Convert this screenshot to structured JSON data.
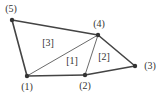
{
  "diagram": {
    "type": "finite-element-mesh",
    "nodes": [
      {
        "id": 1,
        "label": "(1)",
        "x": 27,
        "y": 76,
        "lx": 27,
        "ly": 90
      },
      {
        "id": 2,
        "label": "(2)",
        "x": 85,
        "y": 75,
        "lx": 85,
        "ly": 89
      },
      {
        "id": 3,
        "label": "(3)",
        "x": 135,
        "y": 66,
        "lx": 150,
        "ly": 69
      },
      {
        "id": 4,
        "label": "(4)",
        "x": 98,
        "y": 35,
        "lx": 99,
        "ly": 27
      },
      {
        "id": 5,
        "label": "(5)",
        "x": 12,
        "y": 20,
        "lx": 11,
        "ly": 12
      }
    ],
    "edges": [
      {
        "from": 5,
        "to": 4,
        "boundary": true
      },
      {
        "from": 4,
        "to": 3,
        "boundary": true
      },
      {
        "from": 3,
        "to": 2,
        "boundary": true
      },
      {
        "from": 2,
        "to": 1,
        "boundary": true
      },
      {
        "from": 1,
        "to": 5,
        "boundary": true
      },
      {
        "from": 1,
        "to": 4,
        "boundary": false
      },
      {
        "from": 2,
        "to": 4,
        "boundary": false
      }
    ],
    "elements": [
      {
        "id": 1,
        "label": "[1]",
        "nodes": [
          1,
          2,
          4
        ],
        "lx": 72,
        "ly": 64
      },
      {
        "id": 2,
        "label": "[2]",
        "nodes": [
          2,
          3,
          4
        ],
        "lx": 104,
        "ly": 60
      },
      {
        "id": 3,
        "label": "[3]",
        "nodes": [
          1,
          4,
          5
        ],
        "lx": 48,
        "ly": 46
      }
    ],
    "colors": {
      "line": "#444444",
      "node": "#333333",
      "text": "#333333"
    }
  }
}
